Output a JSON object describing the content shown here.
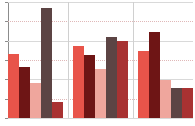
{
  "chart_data": {
    "type": "bar",
    "title": "",
    "subtitle": "",
    "xlabel": "",
    "ylabel": "",
    "ylim": [
      0,
      100
    ],
    "xlim": [
      0,
      3
    ],
    "grid": true,
    "gridlines_y": [
      0,
      16.7,
      33.3,
      50,
      66.7,
      83.3,
      100
    ],
    "legend": "none",
    "categories": [
      "Group 1",
      "Group 2",
      "Group 3"
    ],
    "tick_labels_x": [
      "",
      "",
      ""
    ],
    "tick_labels_y": [
      "",
      "",
      "",
      "",
      "",
      "",
      ""
    ],
    "series": [
      {
        "name": "Series 1",
        "color": "#e8544a",
        "values": [
          55,
          62,
          58
        ]
      },
      {
        "name": "Series 2",
        "color": "#6e1515",
        "values": [
          44,
          54,
          74
        ]
      },
      {
        "name": "Series 3",
        "color": "#efa69d",
        "values": [
          30,
          42,
          33
        ]
      },
      {
        "name": "Series 4",
        "color": "#5c4444",
        "values": [
          95,
          70,
          26
        ]
      },
      {
        "name": "Series 5",
        "color": "#a83232",
        "values": [
          14,
          66,
          26
        ]
      }
    ],
    "bar_layout": {
      "group_count": 3,
      "bars_per_group": 5,
      "bar_width_px": 12,
      "group_gap_px": 10
    },
    "colors": {
      "axis": "#8c8c8c",
      "grid": "#d9d9d9",
      "grid_dotted": "#e0b8b8",
      "background": "#ffffff"
    }
  }
}
